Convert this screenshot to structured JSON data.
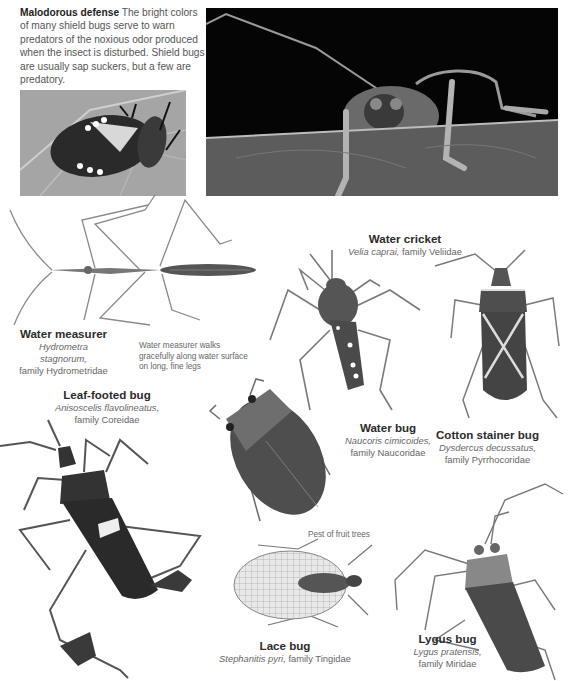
{
  "intro": {
    "heading": "Malodorous defense",
    "body": "The bright colors of many shield bugs serve to warn predators of the noxious odor produced when the insect is disturbed. Shield bugs are usually sap suckers, but a few are predatory."
  },
  "photos": [
    {
      "id": "shield-bug-photo",
      "subject": "Shield bug on leaf"
    },
    {
      "id": "bug-closeup-photo",
      "subject": "Bug peering over leaf edge"
    }
  ],
  "specimens": [
    {
      "name": "Water measurer",
      "latin": "Hydrometra stagnorum,",
      "family": "family Hydrometridae"
    },
    {
      "name": "Water cricket",
      "latin": "Velia caprai,",
      "family": "family Veliidae"
    },
    {
      "name": "Leaf-footed bug",
      "latin": "Anisoscelis flavolineatus,",
      "family": "family Coreidae"
    },
    {
      "name": "Water bug",
      "latin": "Naucoris cimicoides,",
      "family": "family Naucoridae"
    },
    {
      "name": "Cotton stainer bug",
      "latin": "Dysdercus decussatus,",
      "family": "family Pyrrhocoridae"
    },
    {
      "name": "Lace bug",
      "latin": "Stephanitis pyri,",
      "family": "family Tingidae"
    },
    {
      "name": "Lygus bug",
      "latin": "Lygus pratensis,",
      "family": "family Miridae"
    }
  ],
  "notes": {
    "water_measurer": "Water measurer walks gracefully along water surface on long, fine legs",
    "lace_bug": "Pest of fruit trees"
  }
}
